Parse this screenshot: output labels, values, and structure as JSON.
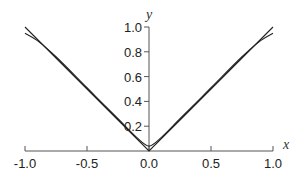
{
  "chart_data": {
    "type": "line",
    "title": "",
    "xlabel": "x",
    "ylabel": "y",
    "xlim": [
      -1.0,
      1.0
    ],
    "ylim": [
      0.0,
      1.0
    ],
    "grid": false,
    "legend": null,
    "x_ticks": [
      "-1.0",
      "-0.5",
      "0.0",
      "0.5",
      "1.0"
    ],
    "y_ticks": [
      "0.2",
      "0.4",
      "0.6",
      "0.8",
      "1.0"
    ],
    "series": [
      {
        "name": "|x|",
        "x": [
          -1.0,
          -0.75,
          -0.5,
          -0.25,
          0.0,
          0.25,
          0.5,
          0.75,
          1.0
        ],
        "y": [
          1.0,
          0.75,
          0.5,
          0.25,
          0.0,
          0.25,
          0.5,
          0.75,
          1.0
        ]
      },
      {
        "name": "smooth approximation",
        "x": [
          -1.0,
          -0.9,
          -0.75,
          -0.5,
          -0.25,
          -0.1,
          0.0,
          0.1,
          0.25,
          0.5,
          0.75,
          0.9,
          1.0
        ],
        "y": [
          0.95,
          0.89,
          0.76,
          0.51,
          0.26,
          0.11,
          0.04,
          0.11,
          0.26,
          0.51,
          0.76,
          0.89,
          0.95
        ]
      }
    ]
  },
  "colors": {
    "axis": "#555555",
    "line": "#222222"
  }
}
